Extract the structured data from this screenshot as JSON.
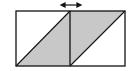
{
  "diagram": {
    "colors": {
      "stroke": "#111111",
      "shade": "#c8c8c8",
      "background": "#ffffff"
    },
    "arrow": {
      "symbol": "double-headed horizontal arrow"
    }
  }
}
